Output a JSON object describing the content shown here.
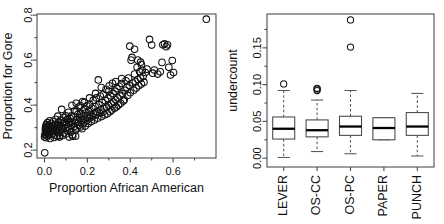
{
  "figure": {
    "title": "",
    "panels": [
      "scatter-proportion-gore",
      "boxplot-undercount-by-method"
    ]
  },
  "chart_data": [
    {
      "type": "scatter",
      "panel_id": "left",
      "title": "",
      "xlabel": "Proportion African American",
      "ylabel": "Proportion for Gore",
      "xlim": [
        -0.035,
        0.8
      ],
      "ylim": [
        0.165,
        0.805
      ],
      "xticks": [
        0.0,
        0.2,
        0.4,
        0.6
      ],
      "xticklabels": [
        "0.0",
        "0.2",
        "0.4",
        "0.6"
      ],
      "xminorticks": [
        0.1,
        0.3,
        0.5,
        0.7
      ],
      "yticks": [
        0.2,
        0.4,
        0.6,
        0.8
      ],
      "yticklabels": [
        "0.2",
        "0.4",
        "0.6",
        "0.8"
      ],
      "yminorticks": [
        0.3,
        0.5,
        0.7
      ],
      "grid": false,
      "marker": "open-circle",
      "marker_size": 3.3,
      "legend": null,
      "points": [
        [
          0.755,
          0.782
        ],
        [
          0.001,
          0.188
        ],
        [
          0.0,
          0.258
        ],
        [
          0.002,
          0.268
        ],
        [
          0.004,
          0.289
        ],
        [
          0.005,
          0.302
        ],
        [
          0.006,
          0.296
        ],
        [
          0.007,
          0.283
        ],
        [
          0.008,
          0.313
        ],
        [
          0.01,
          0.306
        ],
        [
          0.012,
          0.291
        ],
        [
          0.013,
          0.275
        ],
        [
          0.014,
          0.322
        ],
        [
          0.016,
          0.299
        ],
        [
          0.018,
          0.285
        ],
        [
          0.02,
          0.311
        ],
        [
          0.022,
          0.268
        ],
        [
          0.024,
          0.33
        ],
        [
          0.026,
          0.296
        ],
        [
          0.028,
          0.281
        ],
        [
          0.03,
          0.305
        ],
        [
          0.032,
          0.318
        ],
        [
          0.034,
          0.293
        ],
        [
          0.036,
          0.272
        ],
        [
          0.038,
          0.308
        ],
        [
          0.04,
          0.327
        ],
        [
          0.042,
          0.289
        ],
        [
          0.045,
          0.301
        ],
        [
          0.048,
          0.266
        ],
        [
          0.05,
          0.315
        ],
        [
          0.052,
          0.337
        ],
        [
          0.055,
          0.292
        ],
        [
          0.058,
          0.279
        ],
        [
          0.06,
          0.31
        ],
        [
          0.062,
          0.351
        ],
        [
          0.064,
          0.298
        ],
        [
          0.066,
          0.324
        ],
        [
          0.068,
          0.286
        ],
        [
          0.07,
          0.307
        ],
        [
          0.072,
          0.265
        ],
        [
          0.075,
          0.333
        ],
        [
          0.078,
          0.3
        ],
        [
          0.08,
          0.381
        ],
        [
          0.082,
          0.318
        ],
        [
          0.085,
          0.292
        ],
        [
          0.088,
          0.345
        ],
        [
          0.09,
          0.276
        ],
        [
          0.092,
          0.309
        ],
        [
          0.095,
          0.328
        ],
        [
          0.098,
          0.296
        ],
        [
          0.1,
          0.352
        ],
        [
          0.102,
          0.313
        ],
        [
          0.105,
          0.287
        ],
        [
          0.108,
          0.336
        ],
        [
          0.11,
          0.302
        ],
        [
          0.112,
          0.368
        ],
        [
          0.115,
          0.321
        ],
        [
          0.118,
          0.294
        ],
        [
          0.12,
          0.341
        ],
        [
          0.122,
          0.279
        ],
        [
          0.125,
          0.31
        ],
        [
          0.128,
          0.399
        ],
        [
          0.13,
          0.327
        ],
        [
          0.132,
          0.262
        ],
        [
          0.135,
          0.348
        ],
        [
          0.138,
          0.305
        ],
        [
          0.14,
          0.374
        ],
        [
          0.142,
          0.319
        ],
        [
          0.145,
          0.289
        ],
        [
          0.148,
          0.408
        ],
        [
          0.15,
          0.336
        ],
        [
          0.152,
          0.298
        ],
        [
          0.155,
          0.358
        ],
        [
          0.158,
          0.324
        ],
        [
          0.16,
          0.391
        ],
        [
          0.162,
          0.311
        ],
        [
          0.165,
          0.344
        ],
        [
          0.168,
          0.303
        ],
        [
          0.17,
          0.363
        ],
        [
          0.172,
          0.332
        ],
        [
          0.175,
          0.295
        ],
        [
          0.178,
          0.416
        ],
        [
          0.18,
          0.35
        ],
        [
          0.182,
          0.32
        ],
        [
          0.185,
          0.381
        ],
        [
          0.188,
          0.338
        ],
        [
          0.19,
          0.307
        ],
        [
          0.192,
          0.365
        ],
        [
          0.195,
          0.329
        ],
        [
          0.198,
          0.397
        ],
        [
          0.2,
          0.352
        ],
        [
          0.203,
          0.318
        ],
        [
          0.206,
          0.372
        ],
        [
          0.209,
          0.342
        ],
        [
          0.212,
          0.404
        ],
        [
          0.215,
          0.356
        ],
        [
          0.218,
          0.327
        ],
        [
          0.221,
          0.386
        ],
        [
          0.224,
          0.348
        ],
        [
          0.227,
          0.421
        ],
        [
          0.23,
          0.363
        ],
        [
          0.233,
          0.334
        ],
        [
          0.236,
          0.394
        ],
        [
          0.239,
          0.356
        ],
        [
          0.242,
          0.432
        ],
        [
          0.245,
          0.371
        ],
        [
          0.248,
          0.342
        ],
        [
          0.251,
          0.512
        ],
        [
          0.254,
          0.402
        ],
        [
          0.257,
          0.364
        ],
        [
          0.26,
          0.44
        ],
        [
          0.263,
          0.379
        ],
        [
          0.266,
          0.349
        ],
        [
          0.269,
          0.412
        ],
        [
          0.272,
          0.368
        ],
        [
          0.275,
          0.448
        ],
        [
          0.278,
          0.386
        ],
        [
          0.281,
          0.356
        ],
        [
          0.284,
          0.42
        ],
        [
          0.287,
          0.47
        ],
        [
          0.29,
          0.391
        ],
        [
          0.293,
          0.362
        ],
        [
          0.296,
          0.43
        ],
        [
          0.299,
          0.398
        ],
        [
          0.302,
          0.486
        ],
        [
          0.305,
          0.371
        ],
        [
          0.308,
          0.442
        ],
        [
          0.311,
          0.406
        ],
        [
          0.314,
          0.378
        ],
        [
          0.317,
          0.497
        ],
        [
          0.32,
          0.452
        ],
        [
          0.323,
          0.414
        ],
        [
          0.326,
          0.386
        ],
        [
          0.329,
          0.462
        ],
        [
          0.332,
          0.424
        ],
        [
          0.335,
          0.392
        ],
        [
          0.338,
          0.473
        ],
        [
          0.341,
          0.432
        ],
        [
          0.345,
          0.4
        ],
        [
          0.348,
          0.484
        ],
        [
          0.352,
          0.441
        ],
        [
          0.356,
          0.408
        ],
        [
          0.36,
          0.496
        ],
        [
          0.364,
          0.451
        ],
        [
          0.368,
          0.418
        ],
        [
          0.372,
          0.424
        ],
        [
          0.376,
          0.466
        ],
        [
          0.38,
          0.508
        ],
        [
          0.384,
          0.478
        ],
        [
          0.388,
          0.443
        ],
        [
          0.392,
          0.52
        ],
        [
          0.396,
          0.487
        ],
        [
          0.4,
          0.455
        ],
        [
          0.404,
          0.6
        ],
        [
          0.408,
          0.612
        ],
        [
          0.412,
          0.498
        ],
        [
          0.416,
          0.466
        ],
        [
          0.42,
          0.538
        ],
        [
          0.424,
          0.505
        ],
        [
          0.428,
          0.476
        ],
        [
          0.432,
          0.568
        ],
        [
          0.436,
          0.514
        ],
        [
          0.44,
          0.486
        ],
        [
          0.444,
          0.548
        ],
        [
          0.448,
          0.52
        ],
        [
          0.452,
          0.494
        ],
        [
          0.456,
          0.556
        ],
        [
          0.46,
          0.528
        ],
        [
          0.464,
          0.502
        ],
        [
          0.47,
          0.545
        ],
        [
          0.398,
          0.662
        ],
        [
          0.42,
          0.648
        ],
        [
          0.435,
          0.6
        ],
        [
          0.448,
          0.591
        ],
        [
          0.452,
          0.58
        ],
        [
          0.49,
          0.692
        ],
        [
          0.478,
          0.56
        ],
        [
          0.5,
          0.667
        ],
        [
          0.505,
          0.542
        ],
        [
          0.512,
          0.556
        ],
        [
          0.528,
          0.538
        ],
        [
          0.54,
          0.548
        ],
        [
          0.548,
          0.59
        ],
        [
          0.552,
          0.668
        ],
        [
          0.56,
          0.672
        ],
        [
          0.568,
          0.66
        ],
        [
          0.574,
          0.668
        ],
        [
          0.58,
          0.568
        ],
        [
          0.588,
          0.534
        ],
        [
          0.596,
          0.598
        ],
        [
          0.602,
          0.545
        ],
        [
          0.36,
          0.518
        ],
        [
          0.332,
          0.505
        ],
        [
          0.3,
          0.462
        ],
        [
          0.265,
          0.478
        ],
        [
          0.238,
          0.452
        ],
        [
          0.21,
          0.432
        ],
        [
          0.186,
          0.412
        ],
        [
          0.168,
          0.398
        ],
        [
          0.148,
          0.372
        ],
        [
          0.126,
          0.352
        ],
        [
          0.108,
          0.338
        ],
        [
          0.09,
          0.32
        ],
        [
          0.072,
          0.308
        ],
        [
          0.054,
          0.298
        ],
        [
          0.036,
          0.29
        ],
        [
          0.02,
          0.284
        ],
        [
          0.01,
          0.278
        ],
        [
          0.004,
          0.272
        ],
        [
          0.13,
          0.268
        ],
        [
          0.145,
          0.262
        ],
        [
          0.1,
          0.272
        ],
        [
          0.06,
          0.262
        ],
        [
          0.045,
          0.256
        ],
        [
          0.026,
          0.252
        ],
        [
          0.012,
          0.264
        ],
        [
          0.008,
          0.255
        ],
        [
          0.07,
          0.258
        ],
        [
          0.085,
          0.265
        ],
        [
          0.115,
          0.258
        ]
      ]
    },
    {
      "type": "boxplot",
      "panel_id": "right",
      "title": "",
      "xlabel": "",
      "ylabel": "undercount",
      "ylim": [
        -0.012,
        0.196
      ],
      "yticks": [
        0.0,
        0.05,
        0.1,
        0.15
      ],
      "yticklabels": [
        "0.00",
        "0.05",
        "0.10",
        "0.15"
      ],
      "yminorticks": [
        0.025,
        0.075,
        0.125,
        0.175
      ],
      "grid": false,
      "categories": [
        "LEVER",
        "OS-CC",
        "OS-PC",
        "PAPER",
        "PUNCH"
      ],
      "boxes": [
        {
          "category": "LEVER",
          "lower_whisker": 0.001,
          "q1": 0.026,
          "median": 0.04,
          "q3": 0.056,
          "upper_whisker": 0.092,
          "outliers": [
            0.101
          ]
        },
        {
          "category": "OS-CC",
          "lower_whisker": 0.009,
          "q1": 0.029,
          "median": 0.038,
          "q3": 0.052,
          "upper_whisker": 0.079,
          "outliers": [
            0.092,
            0.094,
            0.095
          ]
        },
        {
          "category": "OS-PC",
          "lower_whisker": 0.006,
          "q1": 0.031,
          "median": 0.043,
          "q3": 0.057,
          "upper_whisker": 0.092,
          "outliers": [
            0.151,
            0.188
          ]
        },
        {
          "category": "PAPER",
          "lower_whisker": 0.025,
          "q1": 0.025,
          "median": 0.041,
          "q3": 0.055,
          "upper_whisker": 0.055,
          "outliers": []
        },
        {
          "category": "PUNCH",
          "lower_whisker": 0.003,
          "q1": 0.031,
          "median": 0.043,
          "q3": 0.062,
          "upper_whisker": 0.088,
          "outliers": []
        }
      ]
    }
  ],
  "colors": {
    "background": "#ffffff",
    "axis": "#4d4d4d",
    "marker_stroke": "#111111",
    "median_line": "#000000",
    "whisker": "#555555"
  }
}
